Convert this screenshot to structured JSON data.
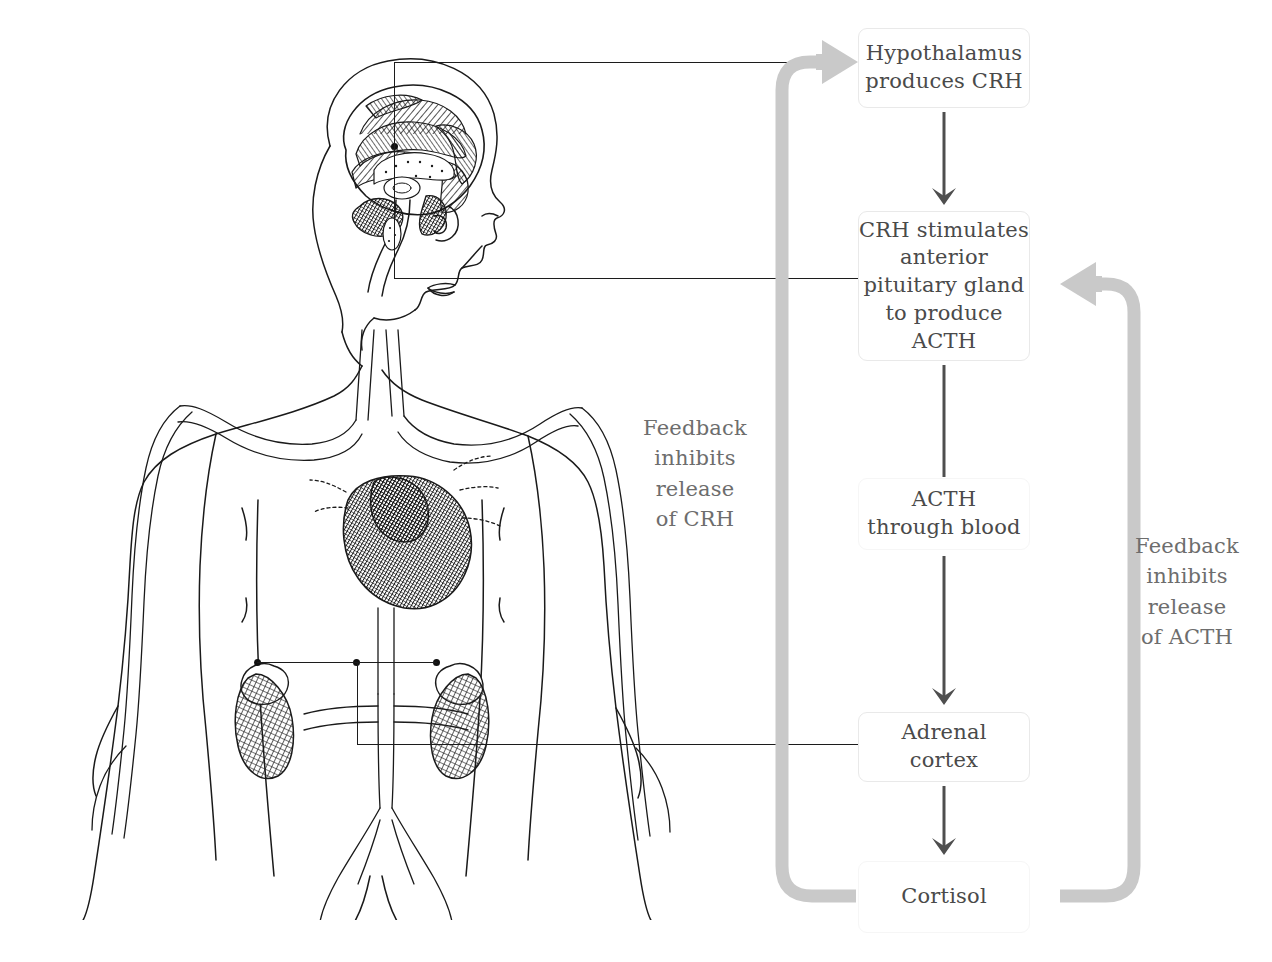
{
  "diagram": {
    "colors": {
      "box_border": "#e9e9e9",
      "box_text": "#4a4a4a",
      "connector": "#4e4e4e",
      "feedback_arrow": "#c9c9c9",
      "feedback_text": "#6d6d6d",
      "leader_line": "#1c1c1c",
      "illustration_ink": "#1a1a1a",
      "background": "#ffffff"
    },
    "flow_boxes": [
      {
        "id": "hypothalamus",
        "lines": [
          "Hypothalamus",
          "produces CRH"
        ]
      },
      {
        "id": "pituitary",
        "lines": [
          "CRH stimulates",
          "anterior",
          "pituitary gland",
          "to produce",
          "ACTH"
        ]
      },
      {
        "id": "acth-blood",
        "lines": [
          "ACTH",
          "through blood"
        ]
      },
      {
        "id": "adrenal",
        "lines": [
          "Adrenal",
          "cortex"
        ]
      },
      {
        "id": "cortisol",
        "lines": [
          "Cortisol"
        ]
      }
    ],
    "feedback_labels": [
      {
        "id": "crh-feedback",
        "lines": [
          "Feedback",
          "inhibits",
          "release",
          "of CRH"
        ]
      },
      {
        "id": "acth-feedback",
        "lines": [
          "Feedback",
          "inhibits",
          "release",
          "of ACTH"
        ]
      }
    ],
    "illustration": {
      "name": "human-body-endocrine-anatomy-engraving",
      "callouts": [
        "hypothalamus",
        "pituitary-gland",
        "adrenal-glands"
      ]
    }
  }
}
